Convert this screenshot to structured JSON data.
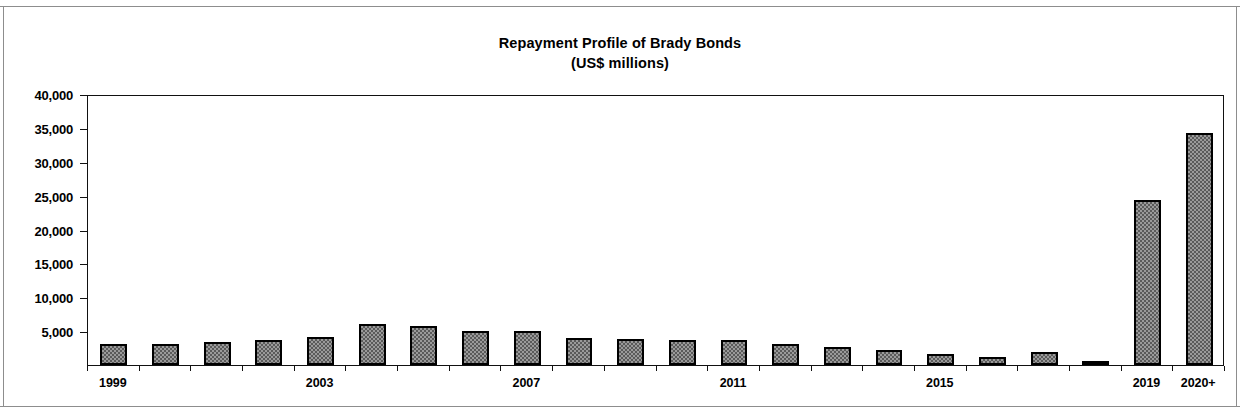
{
  "title": {
    "line1": "Repayment Profile of Brady Bonds",
    "line2": "(US$ millions)"
  },
  "chart_data": {
    "type": "bar",
    "title": "Repayment Profile of Brady Bonds",
    "subtitle": "(US$ millions)",
    "xlabel": "",
    "ylabel": "",
    "ylim": [
      0,
      40000
    ],
    "ytick_values": [
      40000,
      35000,
      30000,
      25000,
      20000,
      15000,
      10000,
      5000
    ],
    "ytick_labels": [
      "40,000",
      "35,000",
      "30,000",
      "25,000",
      "20,000",
      "15,000",
      "10,000",
      "5,000"
    ],
    "grid": false,
    "legend": false,
    "xtick_labels_shown": [
      "1999",
      "2003",
      "2007",
      "2011",
      "2015",
      "2019",
      "2020+"
    ],
    "categories": [
      "1999",
      "2000",
      "2001",
      "2002",
      "2003",
      "2004",
      "2005",
      "2006",
      "2007",
      "2008",
      "2009",
      "2010",
      "2011",
      "2012",
      "2013",
      "2014",
      "2015",
      "2016",
      "2017",
      "2018",
      "2019",
      "2020+"
    ],
    "values": [
      3100,
      3150,
      3400,
      3700,
      4200,
      6100,
      5750,
      5000,
      4950,
      3950,
      3800,
      3650,
      3700,
      3050,
      2600,
      2250,
      1600,
      1250,
      1900,
      450,
      24400,
      34300
    ],
    "series": [
      {
        "name": "Repayment",
        "values": [
          3100,
          3150,
          3400,
          3700,
          4200,
          6100,
          5750,
          5000,
          4950,
          3950,
          3800,
          3650,
          3700,
          3050,
          2600,
          2250,
          1600,
          1250,
          1900,
          450,
          24400,
          34300
        ]
      }
    ],
    "bar_fill": "#9a9a9a",
    "bar_pattern": "checkered-dither",
    "bar_border": "#000000",
    "axis_color": "#111111"
  }
}
